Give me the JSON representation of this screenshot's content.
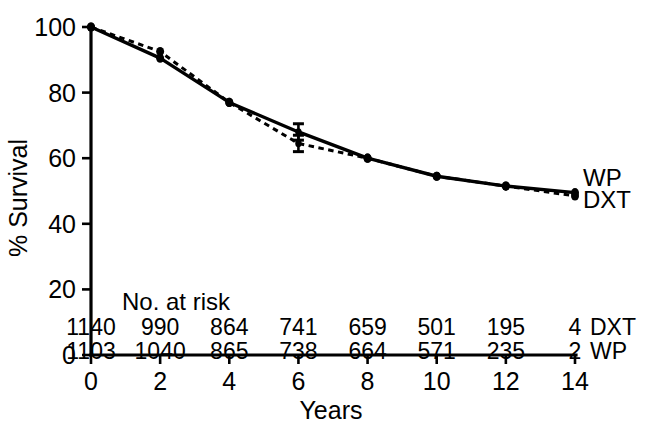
{
  "chart_data": {
    "type": "line",
    "title": "",
    "subtitle": "",
    "xlabel": "Years",
    "ylabel": "% Survival",
    "xlim": [
      0,
      14
    ],
    "ylim": [
      0,
      100
    ],
    "xticks": [
      0,
      2,
      4,
      6,
      8,
      10,
      12,
      14
    ],
    "xtick_labels": [
      "0",
      "2",
      "4",
      "6",
      "8",
      "10",
      "12",
      "14"
    ],
    "yticks": [
      0,
      20,
      40,
      60,
      80,
      100
    ],
    "ytick_labels": [
      "0",
      "20",
      "40",
      "60",
      "80",
      "100"
    ],
    "grid": false,
    "legend_position": "right-end-of-curves",
    "x": [
      0,
      2,
      4,
      6,
      8,
      10,
      12,
      14
    ],
    "series": [
      {
        "name": "WP",
        "style": "solid",
        "label_text": "WP",
        "values": [
          100,
          90.5,
          77.0,
          68.0,
          60.0,
          54.5,
          51.5,
          49.5
        ],
        "error_bars": [
          {
            "x": 6,
            "y": 68.0,
            "lower": 65.5,
            "upper": 70.5
          }
        ]
      },
      {
        "name": "DXT",
        "style": "dashed",
        "label_text": "DXT",
        "values": [
          100,
          92.5,
          77.0,
          64.5,
          60.0,
          54.5,
          51.5,
          48.5
        ],
        "error_bars": [
          {
            "x": 6,
            "y": 64.5,
            "lower": 62.0,
            "upper": 67.0
          }
        ]
      }
    ],
    "risk_table": {
      "title": "No. at risk",
      "x_positions": [
        0,
        2,
        4,
        6,
        8,
        10,
        12,
        14
      ],
      "rows": [
        {
          "label": "DXT",
          "values": [
            "1140",
            "990",
            "864",
            "741",
            "659",
            "501",
            "195",
            "4"
          ]
        },
        {
          "label": "WP",
          "values": [
            "1103",
            "1040",
            "865",
            "738",
            "664",
            "571",
            "235",
            "2"
          ]
        }
      ]
    },
    "colors": {
      "line": "#000000",
      "background": "#ffffff",
      "text": "#000000"
    }
  }
}
